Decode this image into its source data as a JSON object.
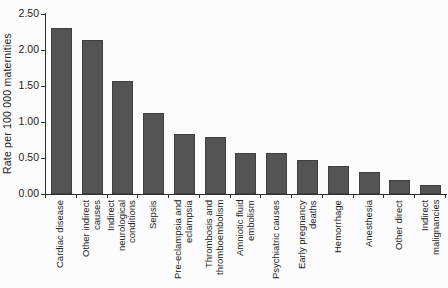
{
  "chart_data": {
    "type": "bar",
    "title": "",
    "xlabel": "",
    "ylabel": "Rate per 100 000 maternities",
    "ylim": [
      0,
      2.5
    ],
    "ytick_labels_top_down": [
      "2.50",
      "2.00",
      "1.50",
      "1.00",
      "0.50",
      "0.00"
    ],
    "grid": false,
    "legend": false,
    "bar_color": "#545454",
    "axis_color": "#2e2e2e",
    "categories": [
      "Cardiac disease",
      "Other indirect causes",
      "Indirect neurological conditions",
      "Sepsis",
      "Pre-eclampsia and eclampsia",
      "Thrombosis and thromboembolism",
      "Amniotic fluid embolism",
      "Psychiatric causes",
      "Early pregnancy deaths",
      "Hemorrhage",
      "Anesthesia",
      "Other direct",
      "Indirect malignancies"
    ],
    "category_label_lines": [
      [
        "Cardiac disease"
      ],
      [
        "Other indirect",
        "causes"
      ],
      [
        "Indirect",
        "neurological",
        "conditions"
      ],
      [
        "Sepsis"
      ],
      [
        "Pre-eclampsia and",
        "eclampsia"
      ],
      [
        "Thrombosis and",
        "thromboembolism"
      ],
      [
        "Amniotic fluid",
        "embolism"
      ],
      [
        "Psychiatric causes"
      ],
      [
        "Early pregnancy",
        "deaths"
      ],
      [
        "Hemorrhage"
      ],
      [
        "Anesthesia"
      ],
      [
        "Other direct"
      ],
      [
        "Indirect",
        "malignancies"
      ]
    ],
    "values": [
      2.31,
      2.14,
      1.57,
      1.13,
      0.83,
      0.79,
      0.57,
      0.57,
      0.47,
      0.39,
      0.31,
      0.19,
      0.13
    ]
  }
}
